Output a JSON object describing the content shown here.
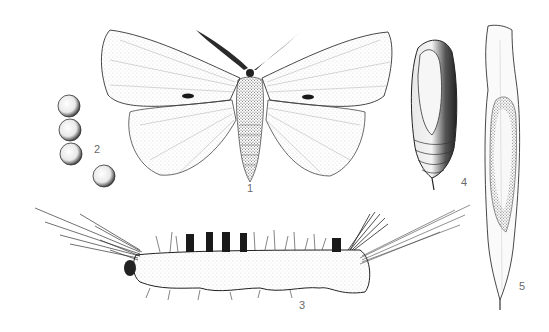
{
  "plate": {
    "background": "#ffffff",
    "ink_color": "#1a1a1a",
    "label_color": "#6a6a6a"
  },
  "figures": [
    {
      "id": "1",
      "label": "1",
      "subject": "adult-moth",
      "description": "Adult moth, wings spread, with discal spots on forewings and feathered antennae"
    },
    {
      "id": "2",
      "label": "2",
      "subject": "eggs",
      "description": "Three stacked eggs and one separate egg"
    },
    {
      "id": "3",
      "label": "3",
      "subject": "caterpillar",
      "description": "Hairy larva with long hair tufts at head and tail, dorsal tufts"
    },
    {
      "id": "4",
      "label": "4",
      "subject": "pupa",
      "description": "Pupa with wing cases and segmented abdomen"
    },
    {
      "id": "5",
      "label": "5",
      "subject": "cocoon-in-leaf",
      "description": "Cocoon spun inside a folded leaf"
    }
  ]
}
